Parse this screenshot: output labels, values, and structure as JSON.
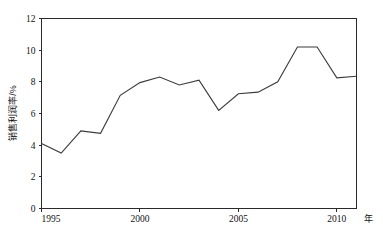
{
  "chart_data": {
    "type": "line",
    "title": "",
    "xlabel": "年",
    "ylabel": "销售利润率/%",
    "xlim": [
      1995,
      2011
    ],
    "ylim": [
      0,
      12
    ],
    "grid": false,
    "legend": null,
    "x_ticks": [
      "1995",
      "2000",
      "2005",
      "2010"
    ],
    "x_tick_values": [
      1995,
      2000,
      2005,
      2010
    ],
    "y_ticks": [
      "0",
      "2",
      "4",
      "6",
      "8",
      "10",
      "12"
    ],
    "y_tick_values": [
      0,
      2,
      4,
      6,
      8,
      10,
      12
    ],
    "x": [
      1995,
      1996,
      1997,
      1998,
      1999,
      2000,
      2001,
      2002,
      2003,
      2004,
      2005,
      2006,
      2007,
      2008,
      2009,
      2010,
      2011
    ],
    "series": [
      {
        "name": "销售利润率",
        "color": "#3a3a3a",
        "values": [
          4.1,
          3.5,
          4.9,
          4.75,
          7.15,
          7.95,
          8.3,
          7.8,
          8.1,
          6.2,
          7.25,
          7.35,
          8.0,
          10.2,
          10.2,
          8.25,
          8.35
        ]
      }
    ]
  },
  "plot": {
    "axis_color": "#2a2a2a",
    "background": "#ffffff"
  }
}
